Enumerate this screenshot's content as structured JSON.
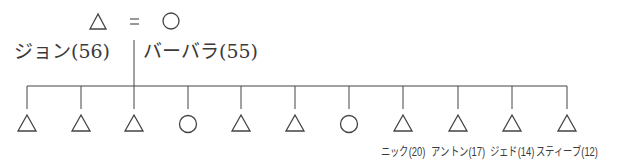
{
  "diagram": {
    "type": "family-tree",
    "legend": {
      "male_symbol": "triangle",
      "equals": "=",
      "female_symbol": "circle"
    },
    "parents": [
      {
        "name": "ジョン(56)",
        "symbol": "triangle"
      },
      {
        "name": "バーバラ(55)",
        "symbol": "circle"
      }
    ],
    "children": [
      {
        "symbol": "triangle",
        "label": ""
      },
      {
        "symbol": "triangle",
        "label": ""
      },
      {
        "symbol": "triangle",
        "label": ""
      },
      {
        "symbol": "circle",
        "label": ""
      },
      {
        "symbol": "triangle",
        "label": ""
      },
      {
        "symbol": "triangle",
        "label": ""
      },
      {
        "symbol": "circle",
        "label": ""
      },
      {
        "symbol": "triangle",
        "label": "ニック(20)"
      },
      {
        "symbol": "triangle",
        "label": "アントン(17)"
      },
      {
        "symbol": "triangle",
        "label": "ジェド(14)"
      },
      {
        "symbol": "triangle",
        "label": "スティーブ(12)"
      }
    ]
  }
}
